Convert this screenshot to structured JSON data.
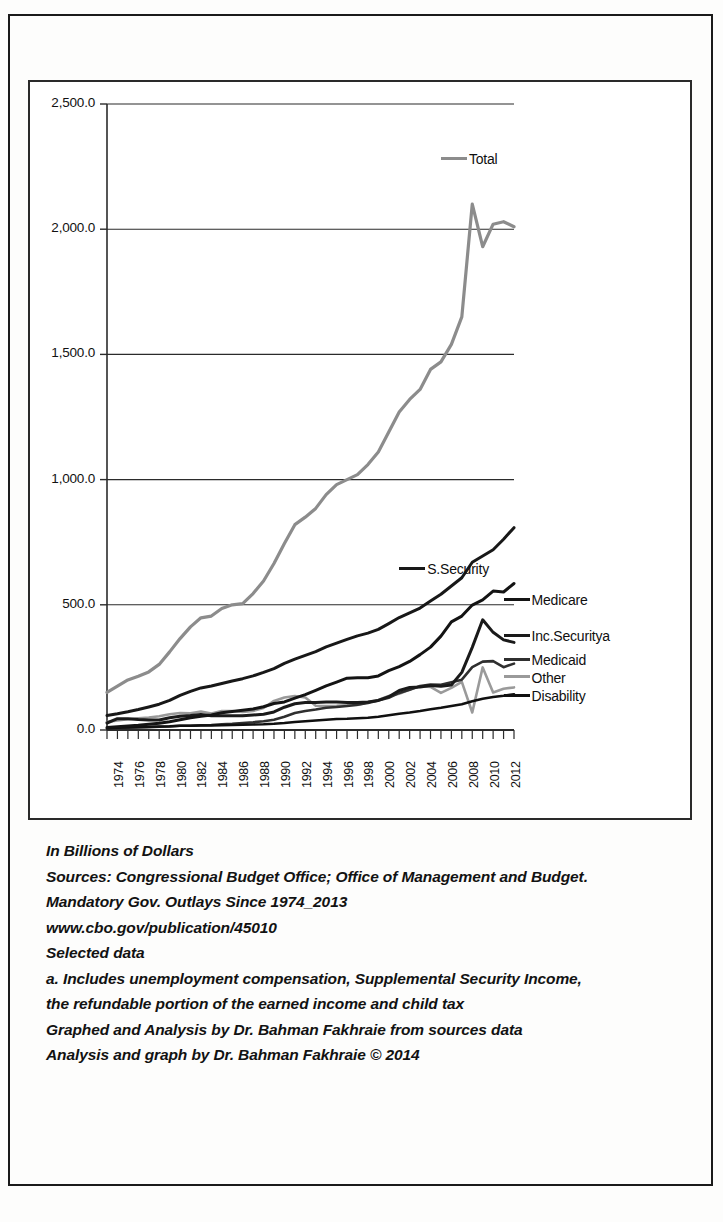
{
  "chart_data": {
    "type": "line",
    "title": "",
    "xlabel": "",
    "ylabel": "",
    "ylim": [
      0,
      2500
    ],
    "ytick_labels": [
      "0.0",
      "500.0",
      "1,000.0",
      "1,500.0",
      "2,000.0",
      "2,500.0"
    ],
    "ytick_values": [
      0,
      500,
      1000,
      1500,
      2000,
      2500
    ],
    "grid": true,
    "legend_position": "in-plot-right",
    "x": [
      1974,
      1975,
      1976,
      1977,
      1978,
      1979,
      1980,
      1981,
      1982,
      1983,
      1984,
      1985,
      1986,
      1987,
      1988,
      1989,
      1990,
      1991,
      1992,
      1993,
      1994,
      1995,
      1996,
      1997,
      1998,
      1999,
      2000,
      2001,
      2002,
      2003,
      2004,
      2005,
      2006,
      2007,
      2008,
      2009,
      2010,
      2011,
      2012,
      2013
    ],
    "xtick_labels": [
      "1974",
      "1976",
      "1978",
      "1980",
      "1982",
      "1984",
      "1986",
      "1988",
      "1990",
      "1992",
      "1994",
      "1996",
      "1998",
      "2000",
      "2002",
      "2004",
      "2006",
      "2008",
      "2010",
      "2012"
    ],
    "series": [
      {
        "name": "Total",
        "color": "#8c8c8c",
        "width": 3.2,
        "values": [
          150,
          175,
          200,
          215,
          232,
          262,
          312,
          365,
          412,
          448,
          455,
          485,
          500,
          505,
          545,
          595,
          665,
          745,
          820,
          850,
          885,
          940,
          980,
          1000,
          1020,
          1060,
          1110,
          1190,
          1270,
          1320,
          1360,
          1440,
          1470,
          1540,
          1650,
          2100,
          1930,
          2020,
          2030,
          2010
        ]
      },
      {
        "name": "S.Security",
        "color": "#181818",
        "width": 3.0,
        "values": [
          58,
          65,
          73,
          82,
          92,
          103,
          118,
          138,
          154,
          168,
          176,
          186,
          196,
          205,
          216,
          230,
          245,
          266,
          283,
          298,
          313,
          332,
          347,
          362,
          376,
          387,
          402,
          425,
          449,
          468,
          487,
          515,
          542,
          575,
          608,
          670,
          695,
          720,
          762,
          808
        ]
      },
      {
        "name": "Medicare",
        "color": "#141414",
        "width": 3.0,
        "values": [
          10,
          13,
          16,
          19,
          23,
          27,
          33,
          41,
          49,
          55,
          60,
          69,
          74,
          79,
          84,
          93,
          106,
          112,
          127,
          141,
          158,
          176,
          191,
          207,
          209,
          209,
          216,
          237,
          253,
          274,
          301,
          331,
          375,
          432,
          455,
          499,
          520,
          555,
          551,
          585
        ]
      },
      {
        "name": "Inc.Securitya",
        "color": "#1a1a1a",
        "width": 3.0,
        "values": [
          28,
          45,
          45,
          42,
          40,
          40,
          49,
          55,
          58,
          62,
          57,
          57,
          57,
          57,
          60,
          63,
          72,
          91,
          105,
          110,
          110,
          112,
          112,
          110,
          110,
          112,
          118,
          133,
          158,
          170,
          172,
          178,
          175,
          180,
          230,
          330,
          440,
          390,
          360,
          350
        ]
      },
      {
        "name": "Medicaid",
        "color": "#2f2f2f",
        "width": 2.6,
        "values": [
          6,
          7,
          9,
          10,
          11,
          13,
          14,
          17,
          17,
          19,
          20,
          23,
          25,
          28,
          31,
          35,
          41,
          53,
          68,
          76,
          82,
          89,
          92,
          96,
          101,
          108,
          118,
          129,
          148,
          161,
          176,
          182,
          181,
          191,
          201,
          251,
          273,
          275,
          251,
          265
        ]
      },
      {
        "name": "Other",
        "color": "#9a9a9a",
        "width": 2.6,
        "values": [
          32,
          38,
          43,
          47,
          50,
          55,
          63,
          68,
          67,
          74,
          66,
          76,
          76,
          72,
          76,
          88,
          116,
          130,
          136,
          130,
          97,
          96,
          97,
          99,
          100,
          111,
          120,
          136,
          145,
          162,
          175,
          172,
          148,
          168,
          192,
          70,
          250,
          150,
          165,
          170
        ]
      },
      {
        "name": "Disability",
        "color": "#101010",
        "width": 2.6,
        "values": [
          7,
          9,
          11,
          12,
          13,
          14,
          15,
          17,
          17,
          18,
          18,
          19,
          20,
          21,
          22,
          23,
          25,
          28,
          32,
          35,
          38,
          41,
          44,
          45,
          47,
          49,
          53,
          59,
          65,
          70,
          76,
          83,
          89,
          96,
          103,
          115,
          125,
          132,
          137,
          143
        ]
      }
    ],
    "annotations": [
      {
        "label": "Total",
        "x": 2006,
        "y": 2275
      },
      {
        "label": "S.Security",
        "x": 2002,
        "y": 640
      },
      {
        "label": "Medicare",
        "x": 2012,
        "y": 515
      },
      {
        "label": "Inc.Securitya",
        "x": 2012,
        "y": 370
      },
      {
        "label": "Medicaid",
        "x": 2012,
        "y": 275
      },
      {
        "label": "Other",
        "x": 2012,
        "y": 205
      },
      {
        "label": "Disability",
        "x": 2012,
        "y": 130
      }
    ]
  },
  "caption": {
    "lines": [
      "In Billions of Dollars",
      "Sources: Congressional Budget Office; Office of Management and Budget.",
      "Mandatory Gov. Outlays Since 1974_2013",
      "www.cbo.gov/publication/45010",
      "Selected data",
      "a. Includes unemployment compensation, Supplemental Security Income,",
      "the refundable portion of the earned income and child tax",
      "Graphed and Analysis by Dr. Bahman Fakhraie from sources data",
      "Analysis and graph by Dr. Bahman Fakhraie © 2014"
    ]
  }
}
